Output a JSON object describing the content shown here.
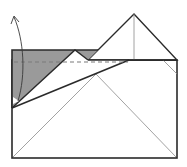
{
  "diagram": {
    "type": "origami-fold-step",
    "colors": {
      "background": "#ffffff",
      "stroke": "#2a2a2a",
      "thin_stroke": "#8a8a8a",
      "shade": "#9a9a9a",
      "dashed": "#7a7a7a"
    },
    "icons": {
      "fold_arrow": "curved-arrow-up-icon",
      "pivot_marker": "small-triangle-icon"
    }
  }
}
